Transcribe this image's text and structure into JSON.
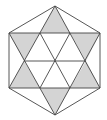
{
  "figure": {
    "title": "",
    "colors": {
      "background": "#ffffff",
      "stroke": "#444444",
      "shade": "#d4d4d4"
    },
    "outer_hexagon": [
      [
        55,
        6
      ],
      [
        100,
        33
      ],
      [
        100,
        88
      ],
      [
        55,
        115
      ],
      [
        9,
        88
      ],
      [
        9,
        33
      ]
    ],
    "triangle_up": [
      [
        55,
        6
      ],
      [
        100,
        88
      ],
      [
        9,
        88
      ]
    ],
    "triangle_down": [
      [
        55,
        115
      ],
      [
        9,
        33
      ],
      [
        100,
        33
      ]
    ],
    "shaded_triangles": [
      [
        [
          55,
          6
        ],
        [
          40,
          33
        ],
        [
          70,
          33
        ]
      ],
      [
        [
          100,
          33
        ],
        [
          70,
          33
        ],
        [
          86,
          61
        ]
      ],
      [
        [
          100,
          88
        ],
        [
          86,
          61
        ],
        [
          70,
          88
        ]
      ],
      [
        [
          55,
          115
        ],
        [
          70,
          88
        ],
        [
          40,
          88
        ]
      ],
      [
        [
          9,
          88
        ],
        [
          40,
          88
        ],
        [
          24,
          61
        ]
      ],
      [
        [
          9,
          33
        ],
        [
          24,
          61
        ],
        [
          40,
          33
        ]
      ]
    ],
    "inner_lines": [
      [
        [
          24,
          61
        ],
        [
          86,
          61
        ]
      ],
      [
        [
          40,
          33
        ],
        [
          70,
          88
        ]
      ],
      [
        [
          70,
          33
        ],
        [
          40,
          88
        ]
      ]
    ]
  }
}
